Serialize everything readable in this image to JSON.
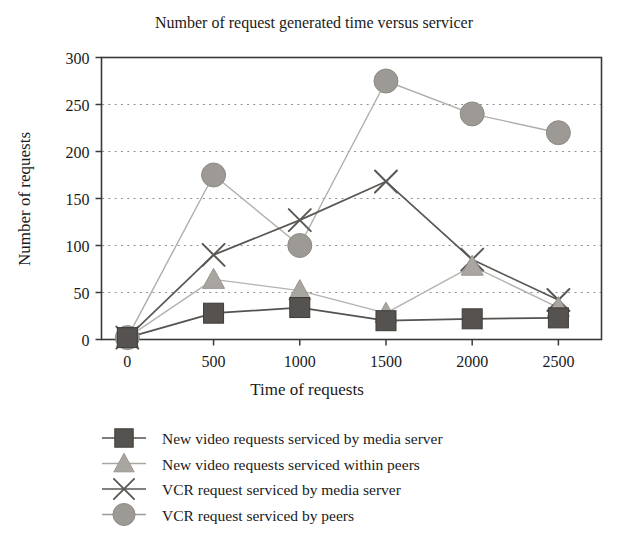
{
  "chart_data": {
    "type": "line",
    "title": "Number of request generated time versus servicer",
    "xlabel": "Time of requests",
    "ylabel": "Number of requests",
    "x": [
      0,
      500,
      1000,
      1500,
      2000,
      2500
    ],
    "xticklabels": [
      "0",
      "500",
      "1000",
      "1500",
      "2000",
      "2500"
    ],
    "yticklabels": [
      "0",
      "50",
      "100",
      "150",
      "200",
      "250",
      "300"
    ],
    "yticks": [
      0,
      50,
      100,
      150,
      200,
      250,
      300
    ],
    "xlim": [
      -150,
      2750
    ],
    "ylim": [
      0,
      300
    ],
    "grid": true,
    "legend_position": "below",
    "series": [
      {
        "name": "New video requests serviced by media server",
        "marker": "square",
        "color": "#55524f",
        "line_color": "#55524f",
        "values": [
          2,
          28,
          34,
          20,
          22,
          23
        ]
      },
      {
        "name": "New video requests serviced within peers",
        "marker": "triangle",
        "color": "#a9a6a2",
        "line_color": "#b5b2ae",
        "values": [
          2,
          64,
          52,
          28,
          78,
          34
        ]
      },
      {
        "name": "VCR request serviced by media server",
        "marker": "cross",
        "color": "#5a5754",
        "line_color": "#5a5754",
        "values": [
          2,
          90,
          127,
          168,
          85,
          42
        ]
      },
      {
        "name": "VCR request serviced by peers",
        "marker": "circle",
        "color": "#9d9a96",
        "line_color": "#b0adaa",
        "values": [
          2,
          175,
          100,
          275,
          240,
          220
        ]
      }
    ]
  },
  "legend": {
    "items": [
      {
        "label": "New video requests serviced by media server",
        "marker": "square-marker",
        "color": "#55524f"
      },
      {
        "label": "New video requests serviced within peers",
        "marker": "triangle-marker",
        "color": "#a9a6a2"
      },
      {
        "label": "VCR request serviced by media server",
        "marker": "cross-marker",
        "color": "#5a5754"
      },
      {
        "label": "VCR request serviced by peers",
        "marker": "circle-marker",
        "color": "#9d9a96"
      }
    ]
  }
}
